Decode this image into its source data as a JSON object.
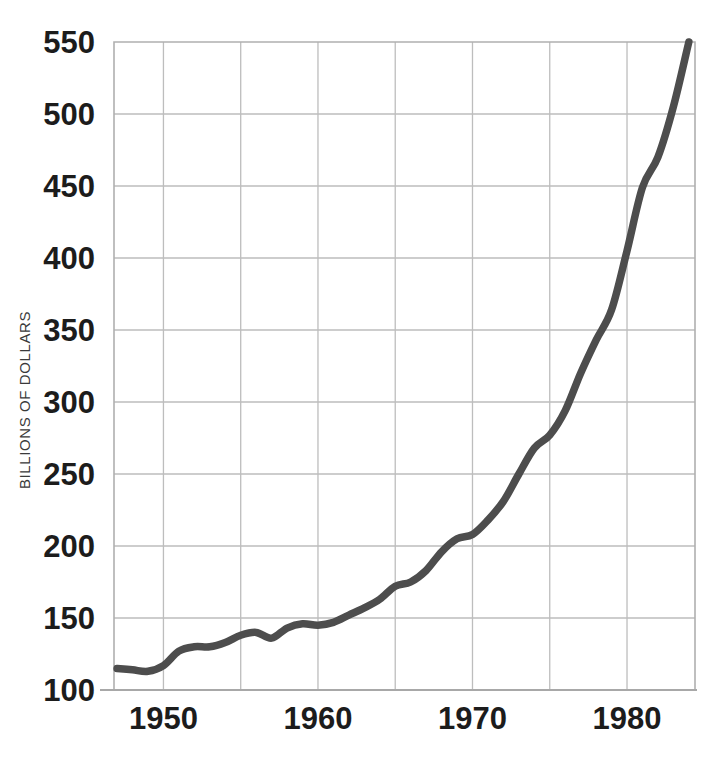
{
  "chart_data": {
    "type": "line",
    "title": "",
    "subtitle": "",
    "xlabel": "",
    "ylabel": "BILLIONS OF DOLLARS",
    "xlim": [
      1946.8,
      1984.4
    ],
    "ylim": [
      100,
      550
    ],
    "grid": true,
    "legend": null,
    "x_ticks": [
      1950,
      1960,
      1970,
      1980
    ],
    "x_tick_labels": [
      "1950",
      "1960",
      "1970",
      "1980"
    ],
    "x_gridlines": [
      1950,
      1955,
      1960,
      1965,
      1970,
      1975,
      1980
    ],
    "y_ticks": [
      100,
      150,
      200,
      250,
      300,
      350,
      400,
      450,
      500,
      550
    ],
    "y_tick_labels": [
      "100",
      "150",
      "200",
      "250",
      "300",
      "350",
      "400",
      "450",
      "500",
      "550"
    ],
    "line_color": "#4d4d4d",
    "grid_color": "#bdbdbd",
    "series": [
      {
        "name": "Billions of dollars",
        "x": [
          1947,
          1948,
          1949,
          1950,
          1951,
          1952,
          1953,
          1954,
          1955,
          1956,
          1957,
          1958,
          1959,
          1960,
          1961,
          1962,
          1963,
          1964,
          1965,
          1966,
          1967,
          1968,
          1969,
          1970,
          1971,
          1972,
          1973,
          1974,
          1975,
          1976,
          1977,
          1978,
          1979,
          1980,
          1981,
          1982,
          1983,
          1984
        ],
        "values": [
          115,
          114,
          113,
          117,
          127,
          130,
          130,
          133,
          138,
          140,
          136,
          143,
          146,
          145,
          147,
          152,
          157,
          163,
          172,
          175,
          183,
          196,
          205,
          208,
          218,
          231,
          250,
          268,
          277,
          294,
          320,
          343,
          364,
          405,
          449,
          470,
          505,
          550
        ]
      }
    ]
  },
  "axes": {
    "y_axis_title": "BILLIONS OF DOLLARS"
  }
}
